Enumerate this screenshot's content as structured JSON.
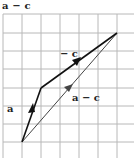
{
  "title": "a − c",
  "diagram": {
    "type": "vector-addition-grid",
    "grid": {
      "columns_x": [
        3,
        22,
        41,
        60,
        79,
        98,
        117
      ],
      "rows_y": [
        14,
        33,
        51,
        69,
        88,
        106,
        124,
        142
      ],
      "color": "#b8b8b8"
    },
    "vectors": [
      {
        "name": "a",
        "label": "a",
        "from": [
          22,
          142
        ],
        "to": [
          41,
          88
        ],
        "color": "#111111",
        "label_pos": [
          7,
          112
        ]
      },
      {
        "name": "minus-c",
        "label": "− c",
        "from": [
          41,
          88
        ],
        "to": [
          117,
          33
        ],
        "color": "#111111",
        "label_pos": [
          63,
          57
        ]
      },
      {
        "name": "a-minus-c",
        "label": "a − c",
        "from": [
          22,
          142
        ],
        "to": [
          117,
          33
        ],
        "color": "#444444",
        "label_pos": [
          73,
          101
        ]
      }
    ]
  },
  "labels": {
    "a": "a",
    "minus_c": "− c",
    "a_minus_c": "a − c"
  }
}
